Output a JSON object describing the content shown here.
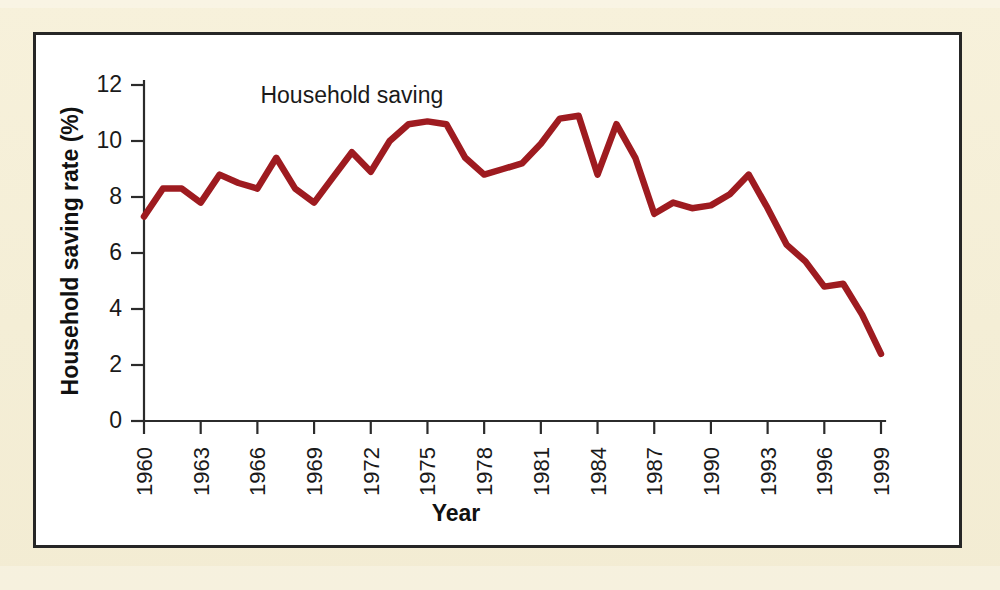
{
  "figure": {
    "background_color": "#f4eed6",
    "panel_color": "#ffffff",
    "frame_color": "#262626"
  },
  "chart_data": {
    "type": "line",
    "title": "",
    "subtitle": "",
    "xlabel": "Year",
    "ylabel": "Household saving rate (%)",
    "xlim": [
      1960,
      1999
    ],
    "ylim": [
      0,
      12
    ],
    "yticks": [
      0,
      2,
      4,
      6,
      8,
      10,
      12
    ],
    "ytick_labels": [
      "0",
      "2",
      "4",
      "6",
      "8",
      "10",
      "12"
    ],
    "xticks": [
      1960,
      1963,
      1966,
      1969,
      1972,
      1975,
      1978,
      1981,
      1984,
      1987,
      1990,
      1993,
      1996,
      1999
    ],
    "xtick_labels": [
      "1960",
      "1963",
      "1966",
      "1969",
      "1972",
      "1975",
      "1978",
      "1981",
      "1984",
      "1987",
      "1990",
      "1993",
      "1996",
      "1999"
    ],
    "xtick_rotation": 90,
    "grid": false,
    "legend": "none",
    "annotations": [
      {
        "text": "Household saving",
        "x": 1971.0,
        "y": 11.35
      }
    ],
    "series": [
      {
        "name": "Household saving",
        "color": "#9e1b20",
        "line_width": 6.5,
        "x": [
          1960,
          1961,
          1962,
          1963,
          1964,
          1965,
          1966,
          1967,
          1968,
          1969,
          1970,
          1971,
          1972,
          1973,
          1974,
          1975,
          1976,
          1977,
          1978,
          1979,
          1980,
          1981,
          1982,
          1983,
          1984,
          1985,
          1986,
          1987,
          1988,
          1989,
          1990,
          1991,
          1992,
          1993,
          1994,
          1995,
          1996,
          1997,
          1998,
          1999
        ],
        "values": [
          7.3,
          8.3,
          8.3,
          7.8,
          8.8,
          8.5,
          8.3,
          9.4,
          8.3,
          7.8,
          8.7,
          9.6,
          8.9,
          10.0,
          10.6,
          10.7,
          10.6,
          9.4,
          8.8,
          9.0,
          9.2,
          9.9,
          10.8,
          10.9,
          8.8,
          10.6,
          9.4,
          7.4,
          7.8,
          7.6,
          7.7,
          8.1,
          8.8,
          7.6,
          6.3,
          5.7,
          4.8,
          4.9,
          3.8,
          2.4
        ]
      }
    ]
  },
  "layout": {
    "plot_left_px": 108,
    "plot_right_px": 845,
    "plot_top_px": 50,
    "plot_bottom_px": 386
  }
}
